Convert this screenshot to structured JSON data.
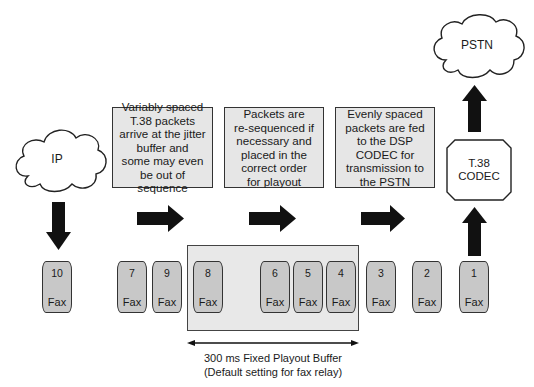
{
  "clouds": {
    "ip": {
      "label": "IP"
    },
    "pstn": {
      "label": "PSTN"
    }
  },
  "codec": {
    "line1": "T.38",
    "line2": "CODEC"
  },
  "steps": [
    {
      "lines": [
        "Variably spaced",
        "T.38 packets",
        "arrive at the jitter",
        "buffer and",
        "some may even",
        "be out of",
        "sequence"
      ]
    },
    {
      "lines": [
        "Packets are",
        "re-sequenced if",
        "necessary and",
        "placed in the",
        "correct order",
        "for playout"
      ]
    },
    {
      "lines": [
        "Evenly spaced",
        "packets are fed",
        "to the DSP",
        "CODEC for",
        "transmission to",
        "the PSTN"
      ]
    }
  ],
  "packets": [
    {
      "num": "10",
      "label": "Fax",
      "x": 42
    },
    {
      "num": "7",
      "label": "Fax",
      "x": 117
    },
    {
      "num": "9",
      "label": "Fax",
      "x": 152
    },
    {
      "num": "8",
      "label": "Fax",
      "x": 193
    },
    {
      "num": "6",
      "label": "Fax",
      "x": 260
    },
    {
      "num": "5",
      "label": "Fax",
      "x": 293
    },
    {
      "num": "4",
      "label": "Fax",
      "x": 326
    },
    {
      "num": "3",
      "label": "Fax",
      "x": 366
    },
    {
      "num": "2",
      "label": "Fax",
      "x": 412
    },
    {
      "num": "1",
      "label": "Fax",
      "x": 459
    }
  ],
  "buffer": {
    "caption_line1": "300 ms Fixed Playout Buffer",
    "caption_line2": "(Default setting for fax relay)"
  },
  "colors": {
    "box_fill": "#e6e6e6",
    "packet_fill": "#c8c8c8",
    "arrow": "#111111",
    "stroke": "#333333"
  }
}
